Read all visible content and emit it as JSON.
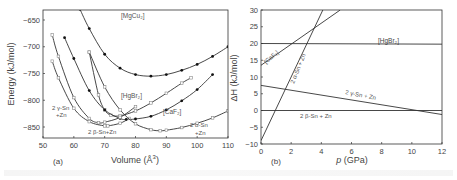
{
  "figure": {
    "panel_a": {
      "tag": "(a)",
      "ylabel": "Energy (kJ/mol)",
      "xlabel_main": "Volume (Å",
      "xlabel_sup": "3",
      "xlabel_close": ")",
      "xticks": [
        "50",
        "60",
        "70",
        "80",
        "90",
        "100",
        "110"
      ],
      "yticks": [
        "-650",
        "-700",
        "-750",
        "-800",
        "-850"
      ],
      "labels": {
        "mgcu2": "[MgCu₂]",
        "hgbr2": "[HgBr₂]",
        "caf2": "[CaF₂]",
        "gamma_1": "2 γ-Sn",
        "gamma_2": "+Zn",
        "beta": "2 β-Sn+Zn",
        "alpha_1": "2 α-Sn",
        "alpha_2": "+Zn"
      }
    },
    "panel_b": {
      "tag": "(b)",
      "ylabel": "ΔH (kJ/mol)",
      "xlabel_italic": "p",
      "xlabel_rest": " (GPa)",
      "xticks": [
        "0",
        "2",
        "4",
        "6",
        "8",
        "10",
        "12"
      ],
      "yticks": [
        "30",
        "25",
        "20",
        "15",
        "10",
        "5",
        "0",
        "-5",
        "-10"
      ],
      "labels": {
        "hgbr2": "[HgBr₂]",
        "caf2": "[CaF₂]",
        "alpha": "2 α-Sn + Zn",
        "gamma": "2 γ-Sn + Zn",
        "beta": "2 β-Sn + Zn"
      }
    }
  },
  "chart_data": [
    {
      "type": "line",
      "title": "(a)",
      "xlabel": "Volume (Å^3)",
      "ylabel": "Energy (kJ/mol)",
      "xlim": [
        50,
        110
      ],
      "ylim": [
        -870,
        -630
      ],
      "grid": false,
      "series": [
        {
          "name": "[MgCu2]",
          "marker": "filled",
          "x": [
            62,
            65,
            70,
            75,
            80,
            85,
            90,
            95,
            100,
            105,
            110
          ],
          "y": [
            -630,
            -666,
            -714,
            -740,
            -752,
            -755,
            -752,
            -744,
            -733,
            -718,
            -700
          ]
        },
        {
          "name": "[HgBr2]",
          "marker": "open",
          "x": [
            65,
            68,
            70,
            72,
            75,
            80,
            85,
            90,
            95,
            98
          ],
          "y": [
            -710,
            -790,
            -818,
            -828,
            -829,
            -820,
            -805,
            -787,
            -768,
            -758
          ]
        },
        {
          "name": "[CaF2]",
          "marker": "filled",
          "x": [
            57,
            60,
            65,
            70,
            75,
            77,
            80,
            85,
            90,
            95,
            100,
            105
          ],
          "y": [
            -683,
            -722,
            -782,
            -818,
            -834,
            -836,
            -835,
            -830,
            -818,
            -801,
            -780,
            -752
          ]
        },
        {
          "name": "2 γ-Sn+Zn",
          "marker": "open",
          "x": [
            53,
            55,
            60,
            65,
            68,
            70,
            75,
            80
          ],
          "y": [
            -678,
            -718,
            -795,
            -834,
            -842,
            -841,
            -832,
            -812
          ]
        },
        {
          "name": "2 β-Sn+Zn",
          "marker": "open",
          "x": [
            53,
            55,
            60,
            65,
            70,
            71,
            75,
            78
          ],
          "y": [
            -727,
            -758,
            -815,
            -840,
            -848,
            -848,
            -843,
            -834
          ]
        },
        {
          "name": "2 α-Sn+Zn",
          "marker": "open",
          "x": [
            65,
            70,
            75,
            80,
            85,
            88,
            90,
            95,
            100,
            105,
            110
          ],
          "y": [
            -710,
            -775,
            -818,
            -844,
            -855,
            -857,
            -856,
            -851,
            -843,
            -833,
            -820
          ]
        }
      ]
    },
    {
      "type": "line",
      "title": "(b)",
      "xlabel": "p (GPa)",
      "ylabel": "ΔH (kJ/mol)",
      "xlim": [
        0,
        12
      ],
      "ylim": [
        -10,
        30
      ],
      "grid": false,
      "series": [
        {
          "name": "[HgBr2]",
          "x": [
            0,
            12
          ],
          "y": [
            20,
            19.8
          ]
        },
        {
          "name": "[CaF2]",
          "x": [
            0,
            5.25
          ],
          "y": [
            13.5,
            30
          ]
        },
        {
          "name": "2 α-Sn + Zn",
          "x": [
            0,
            4.1
          ],
          "y": [
            -9,
            30
          ]
        },
        {
          "name": "2 γ-Sn + Zn",
          "x": [
            0,
            12
          ],
          "y": [
            7.5,
            -1.2
          ]
        },
        {
          "name": "2 β-Sn + Zn",
          "x": [
            0,
            12
          ],
          "y": [
            0,
            0
          ]
        }
      ]
    }
  ]
}
